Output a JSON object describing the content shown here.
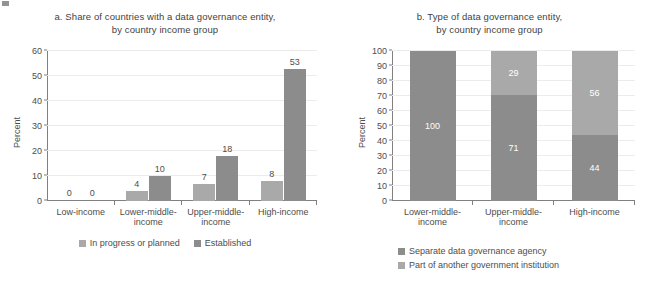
{
  "colors": {
    "light_gray": "#a9a9a9",
    "dark_gray": "#8c8c8c",
    "axis": "#808080",
    "grid": "#ececec",
    "text": "#4d4d4d",
    "value_label_on_bar": "#ffffff"
  },
  "panel_a": {
    "title_line1": "a. Share of countries with a data governance entity,",
    "title_line2": "by country income group",
    "ylabel": "Percent",
    "legend": [
      {
        "label": "In progress or planned",
        "color": "#a9a9a9"
      },
      {
        "label": "Established",
        "color": "#8c8c8c"
      }
    ]
  },
  "panel_b": {
    "title_line1": "b. Type of data governance entity,",
    "title_line2": "by country income group",
    "ylabel": "Percent",
    "legend": [
      {
        "label": "Separate data governance agency",
        "color": "#8c8c8c"
      },
      {
        "label": "Part of another government institution",
        "color": "#a9a9a9"
      }
    ]
  },
  "chart_data": [
    {
      "type": "bar",
      "id": "panel-a",
      "title": "a. Share of countries with a data governance entity, by country income group",
      "xlabel": "",
      "ylabel": "Percent",
      "ylim": [
        0,
        60
      ],
      "yticks": [
        0,
        10,
        20,
        30,
        40,
        50,
        60
      ],
      "grid": true,
      "legend_position": "bottom",
      "grouping": "grouped",
      "categories": [
        "Low-income",
        "Lower-middle-income",
        "Upper-middle-income",
        "High-income"
      ],
      "category_lines": [
        [
          "Low-income"
        ],
        [
          "Lower-middle-",
          "income"
        ],
        [
          "Upper-middle-",
          "income"
        ],
        [
          "High-income"
        ]
      ],
      "series": [
        {
          "name": "In progress or planned",
          "color": "#a9a9a9",
          "values": [
            0,
            4,
            7,
            8
          ]
        },
        {
          "name": "Established",
          "color": "#8c8c8c",
          "values": [
            0,
            10,
            18,
            53
          ]
        }
      ]
    },
    {
      "type": "bar",
      "id": "panel-b",
      "title": "b. Type of data governance entity, by country income group",
      "xlabel": "",
      "ylabel": "Percent",
      "ylim": [
        0,
        100
      ],
      "yticks": [
        0,
        10,
        20,
        30,
        40,
        50,
        60,
        70,
        80,
        90,
        100
      ],
      "grid": true,
      "legend_position": "bottom",
      "grouping": "stacked-100",
      "categories": [
        "Lower-middle-income",
        "Upper-middle-income",
        "High-income"
      ],
      "category_lines": [
        [
          "Lower-middle-",
          "income"
        ],
        [
          "Upper-middle-",
          "income"
        ],
        [
          "High-income"
        ]
      ],
      "series": [
        {
          "name": "Separate data governance agency",
          "color": "#8c8c8c",
          "values": [
            100,
            71,
            44
          ]
        },
        {
          "name": "Part of another government institution",
          "color": "#a9a9a9",
          "values": [
            null,
            29,
            56
          ]
        }
      ]
    }
  ]
}
